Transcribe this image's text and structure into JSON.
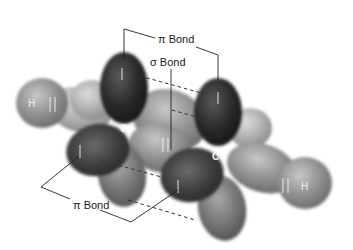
{
  "diagram": {
    "type": "molecular-orbital",
    "labels": {
      "pi_bond_top": "π Bond",
      "sigma_bond": "σ Bond",
      "pi_bond_bottom": "π Bond",
      "carbon_left": "C",
      "carbon_right": "C",
      "hydrogen_left": "H",
      "hydrogen_right": "H"
    },
    "electron_spins": {
      "top_left_p_lobe": "↑",
      "top_right_p_lobe": "↓",
      "bottom_left_p_lobe": "↑",
      "bottom_right_p_lobe": "↓",
      "sigma_cc": "↓↑",
      "h_left": "↓↑",
      "h_right": "↓↑"
    },
    "colors": {
      "p_orbital": "#2e2e2e",
      "sp2_orbital": "#8a8a8a",
      "hydrogen_s": "#9a9a9a",
      "leader_line": "#222222",
      "background": "#ffffff"
    }
  }
}
